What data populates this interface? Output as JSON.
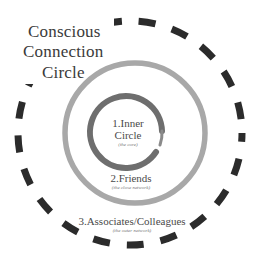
{
  "title": {
    "line1": "Conscious",
    "line2": "Connection",
    "line3": "Circle"
  },
  "rings": [
    {
      "id": "inner",
      "label_line1": "1.Inner",
      "label_line2": "Circle",
      "sublabel": "(the core)"
    },
    {
      "id": "friends",
      "label": "2.Friends",
      "sublabel": "(the close network)"
    },
    {
      "id": "associates",
      "label": "3.Associates/Colleagues",
      "sublabel": "(the outer network)"
    }
  ],
  "colors": {
    "inner_ring": "#6e6e6e",
    "middle_ring": "#a8a8a8",
    "outer_dashes": "#2b2b2b",
    "accent_strokes": "#c8c8c8",
    "text": "#3a3a3a"
  }
}
